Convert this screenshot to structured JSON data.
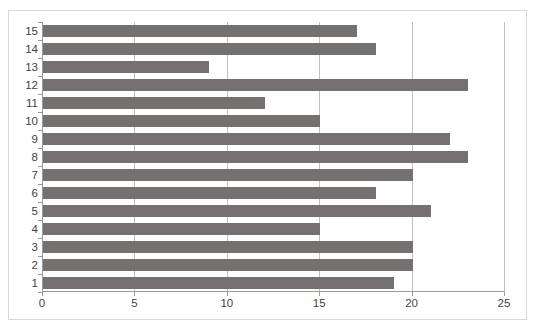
{
  "chart_data": {
    "type": "bar",
    "orientation": "horizontal",
    "title": "",
    "subtitle": "",
    "xlabel": "",
    "ylabel": "",
    "categories": [
      "1",
      "2",
      "3",
      "4",
      "5",
      "6",
      "7",
      "8",
      "9",
      "10",
      "11",
      "12",
      "13",
      "14",
      "15"
    ],
    "values": [
      19,
      20,
      20,
      15,
      21,
      18,
      20,
      23,
      22,
      15,
      12,
      23,
      9,
      18,
      17
    ],
    "series": [
      {
        "name": "Series 1",
        "values": [
          19,
          20,
          20,
          15,
          21,
          18,
          20,
          23,
          22,
          15,
          12,
          23,
          9,
          18,
          17
        ]
      }
    ],
    "xlim": [
      0,
      25
    ],
    "x_ticks": [
      0,
      5,
      10,
      15,
      20,
      25
    ],
    "x_tick_labels": [
      "0",
      "5",
      "10",
      "15",
      "20",
      "25"
    ],
    "y_tick_labels_top_to_bottom": [
      "15",
      "14",
      "13",
      "12",
      "11",
      "10",
      "9",
      "8",
      "7",
      "6",
      "5",
      "4",
      "3",
      "2",
      "1"
    ],
    "grid": {
      "vertical": true,
      "horizontal": false
    },
    "legend": {
      "visible": false,
      "position": "none"
    },
    "colors": {
      "bar": "#767171",
      "gridline": "#bfbfbf",
      "axis": "#9a9a9a",
      "border": "#d9d9d9",
      "tick_text": "#3f3f3f",
      "background": "#ffffff"
    }
  }
}
